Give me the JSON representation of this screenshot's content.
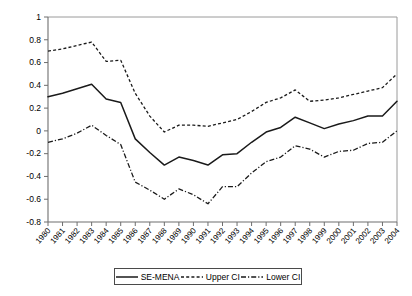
{
  "chart_data": {
    "type": "line",
    "title": "",
    "xlabel": "",
    "ylabel": "",
    "ylim": [
      -0.8,
      1
    ],
    "yticks": [
      1,
      0.8,
      0.6,
      0.4,
      0.2,
      0,
      -0.2,
      -0.4,
      -0.6,
      -0.8
    ],
    "ytick_labels": [
      "1",
      "0.8",
      "0.6",
      "0.4",
      "0.2",
      "0",
      "-0.2",
      "-0.4",
      "-0.6",
      "-0.8"
    ],
    "grid": false,
    "legend_position": "bottom",
    "categories": [
      "1980",
      "1981",
      "1982",
      "1983",
      "1984",
      "1985",
      "1986",
      "1987",
      "1988",
      "1989",
      "1990",
      "1991",
      "1992",
      "1993",
      "1994",
      "1995",
      "1996",
      "1997",
      "1998",
      "1999",
      "2000",
      "2001",
      "2002",
      "2003",
      "2004"
    ],
    "series": [
      {
        "name": "SE-MENA",
        "style": "solid",
        "values": [
          0.3,
          0.33,
          0.37,
          0.41,
          0.28,
          0.25,
          -0.07,
          -0.19,
          -0.3,
          -0.23,
          -0.26,
          -0.3,
          -0.21,
          -0.2,
          -0.1,
          -0.01,
          0.03,
          0.12,
          0.07,
          0.02,
          0.06,
          0.09,
          0.13,
          0.13,
          0.26
        ]
      },
      {
        "name": "Upper CI",
        "style": "dashed",
        "values": [
          0.7,
          0.72,
          0.75,
          0.78,
          0.61,
          0.62,
          0.33,
          0.13,
          -0.01,
          0.05,
          0.05,
          0.04,
          0.07,
          0.1,
          0.17,
          0.25,
          0.29,
          0.36,
          0.26,
          0.27,
          0.29,
          0.32,
          0.35,
          0.38,
          0.5
        ]
      },
      {
        "name": "Lower CI",
        "style": "dashdot",
        "values": [
          -0.1,
          -0.07,
          -0.02,
          0.05,
          -0.04,
          -0.12,
          -0.45,
          -0.52,
          -0.6,
          -0.51,
          -0.56,
          -0.64,
          -0.49,
          -0.49,
          -0.37,
          -0.27,
          -0.23,
          -0.13,
          -0.16,
          -0.23,
          -0.18,
          -0.17,
          -0.11,
          -0.1,
          0.0
        ]
      }
    ]
  },
  "legend": {
    "entries": [
      {
        "label": "SE-MENA",
        "style": "solid"
      },
      {
        "label": "Upper CI",
        "style": "dashed"
      },
      {
        "label": "Lower CI",
        "style": "dashdot"
      }
    ]
  }
}
